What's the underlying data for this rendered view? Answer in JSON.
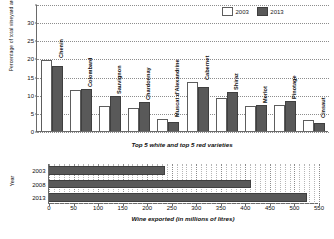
{
  "chart_data": [
    {
      "type": "bar",
      "title": "",
      "subtitle": "Top 5 white and top 5 red varieties",
      "xlabel": "",
      "ylabel": "Percentage of total vineyard area",
      "ylim": [
        0,
        35
      ],
      "yticks": [
        0,
        5,
        10,
        15,
        20,
        25,
        30
      ],
      "grid": true,
      "legend_position": "top-right",
      "categories": [
        "Chenin",
        "Colombard",
        "Sauvignon",
        "Chardonnay",
        "Muscat d'Alexandrine",
        "Cabernet",
        "Shiraz",
        "Merlot",
        "Pinotage",
        "Cinsaut"
      ],
      "series": [
        {
          "name": "2003",
          "color": "#ffffff",
          "values": [
            19.5,
            11.3,
            7.0,
            6.3,
            3.2,
            13.5,
            9.0,
            7.0,
            7.2,
            3.1
          ]
        },
        {
          "name": "2013",
          "color": "#595959",
          "values": [
            17.8,
            11.7,
            9.6,
            8.0,
            2.6,
            12.0,
            10.7,
            7.3,
            8.4,
            2.2
          ]
        }
      ]
    },
    {
      "type": "bar",
      "orientation": "horizontal",
      "title": "",
      "xlabel": "Wine exported (in millions of litres)",
      "ylabel": "Year",
      "xlim": [
        0,
        550
      ],
      "xticks": [
        0,
        50,
        100,
        150,
        200,
        250,
        300,
        350,
        400,
        450,
        500,
        550
      ],
      "grid": true,
      "categories": [
        "2003",
        "2008",
        "2013"
      ],
      "values": [
        237,
        412,
        525
      ],
      "color": "#595959"
    }
  ],
  "top": {
    "ylabel": "Percentage of total vineyard area",
    "subtitle": "Top 5 white and top 5 red varieties",
    "legend": [
      {
        "label": "2003",
        "swatch": "white"
      },
      {
        "label": "2013",
        "swatch": "dark"
      }
    ],
    "yticks": [
      "30",
      "25",
      "20",
      "15",
      "10",
      "5",
      "0"
    ],
    "categories": [
      {
        "label": "Chenin"
      },
      {
        "label": "Colombard"
      },
      {
        "label": "Sauvignon"
      },
      {
        "label": "Chardonnay"
      },
      {
        "label": "Muscat d'Alexandrine"
      },
      {
        "label": "Cabernet"
      },
      {
        "label": "Shiraz"
      },
      {
        "label": "Merlot"
      },
      {
        "label": "Pinotage"
      },
      {
        "label": "Cinsaut"
      }
    ]
  },
  "bottom": {
    "ylabel": "Year",
    "xlabel": "Wine exported (in millions of litres)",
    "rows": [
      {
        "label": "2003",
        "value": 237
      },
      {
        "label": "2008",
        "value": 412
      },
      {
        "label": "2013",
        "value": 525
      }
    ],
    "xticks": [
      "0",
      "50",
      "100",
      "150",
      "200",
      "250",
      "300",
      "350",
      "400",
      "450",
      "500",
      "550"
    ]
  }
}
